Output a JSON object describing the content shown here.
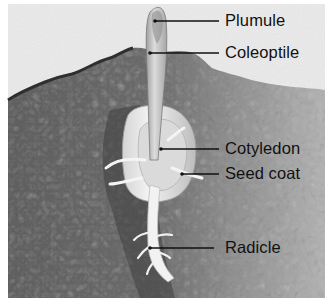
{
  "diagram": {
    "style": "grayscale",
    "labels": [
      {
        "id": "plumule",
        "text": "Plumule",
        "x": 225,
        "y": 12,
        "line": [
          155,
          21,
          219,
          21
        ]
      },
      {
        "id": "coleoptile",
        "text": "Coleoptile",
        "x": 225,
        "y": 43,
        "line": [
          150,
          53,
          219,
          53
        ]
      },
      {
        "id": "cotyledon",
        "text": "Cotyledon",
        "x": 225,
        "y": 140,
        "line": [
          161,
          149,
          219,
          149
        ]
      },
      {
        "id": "seed-coat",
        "text": "Seed coat",
        "x": 225,
        "y": 164,
        "line": [
          182,
          174,
          219,
          174
        ]
      },
      {
        "id": "radicle",
        "text": "Radicle",
        "x": 225,
        "y": 239,
        "line": [
          150,
          248,
          214,
          248
        ]
      }
    ],
    "colors": {
      "sky": "#ececec",
      "soil_dark": "#5a5a5a",
      "soil_mid": "#7d7d7d",
      "soil_light": "#a8a8a8",
      "seed": "#e6e6e6",
      "leader_line": "#111111",
      "text": "#111111"
    }
  }
}
